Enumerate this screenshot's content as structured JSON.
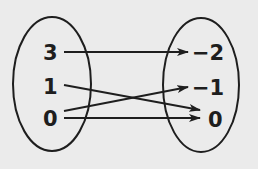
{
  "diagram": {
    "type": "mapping-diagram",
    "background": "#ebebeb",
    "stroke_color": "#1e1e1e",
    "domain": {
      "label": "input-set",
      "values": [
        "3",
        "1",
        "0"
      ]
    },
    "range": {
      "label": "output-set",
      "values": [
        "−2",
        "−1",
        "0"
      ]
    },
    "mappings": [
      {
        "from": "3",
        "to": "−2"
      },
      {
        "from": "1",
        "to": "0"
      },
      {
        "from": "0",
        "to": "−1"
      },
      {
        "from": "0",
        "to": "0"
      }
    ]
  }
}
